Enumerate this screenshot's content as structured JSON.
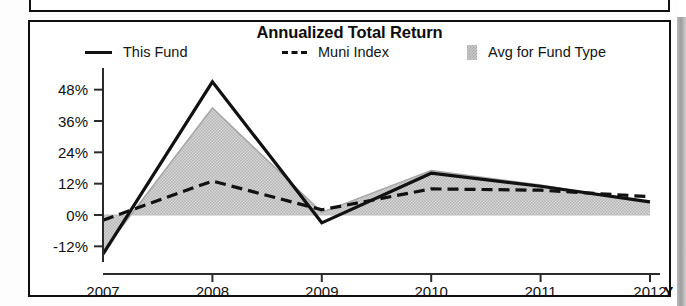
{
  "document": {
    "partial_panel_above": "",
    "scrollbar": "vertical-scrollbar"
  },
  "panel": {
    "title": "Annualized Total Return"
  },
  "legend": {
    "items": [
      {
        "label": "This Fund",
        "marker": "solid-line-swatch",
        "color": "#111111"
      },
      {
        "label": "Muni Index",
        "marker": "dashed-line-swatch",
        "color": "#111111"
      },
      {
        "label": "Avg for Fund Type",
        "marker": "shaded-area-swatch",
        "color": "#c9c9c9"
      }
    ]
  },
  "axes": {
    "y_ticks": [
      "48%",
      "36%",
      "24%",
      "12%",
      "0%",
      "-12%"
    ],
    "x_ticks": [
      "2007",
      "2008",
      "2009",
      "2010",
      "2011",
      "2012"
    ],
    "x_suffix": "YTD"
  },
  "chart_data": {
    "type": "line",
    "title": "Annualized Total Return",
    "xlabel": "",
    "ylabel": "",
    "categories": [
      "2007",
      "2008",
      "2009",
      "2010",
      "2011",
      "2012"
    ],
    "x_axis_note": "2012 is year-to-date (YTD)",
    "ylim": [
      -18,
      54
    ],
    "y_ticks": [
      -12,
      0,
      12,
      24,
      36,
      48
    ],
    "y_tick_labels": [
      "-12%",
      "0%",
      "12%",
      "24%",
      "36%",
      "48%"
    ],
    "grid": false,
    "legend_position": "top",
    "zero_line": true,
    "series": [
      {
        "name": "This Fund",
        "style": "solid",
        "color": "#111111",
        "values": [
          -15,
          51,
          -3,
          16,
          11,
          5
        ]
      },
      {
        "name": "Muni Index",
        "style": "dashed",
        "color": "#111111",
        "values": [
          -2,
          13,
          2,
          10,
          9.5,
          7
        ]
      },
      {
        "name": "Avg for Fund Type",
        "style": "filled-area",
        "color": "#c9c9c9",
        "values": [
          -14,
          41,
          1,
          17,
          11.5,
          4.5
        ]
      }
    ]
  }
}
